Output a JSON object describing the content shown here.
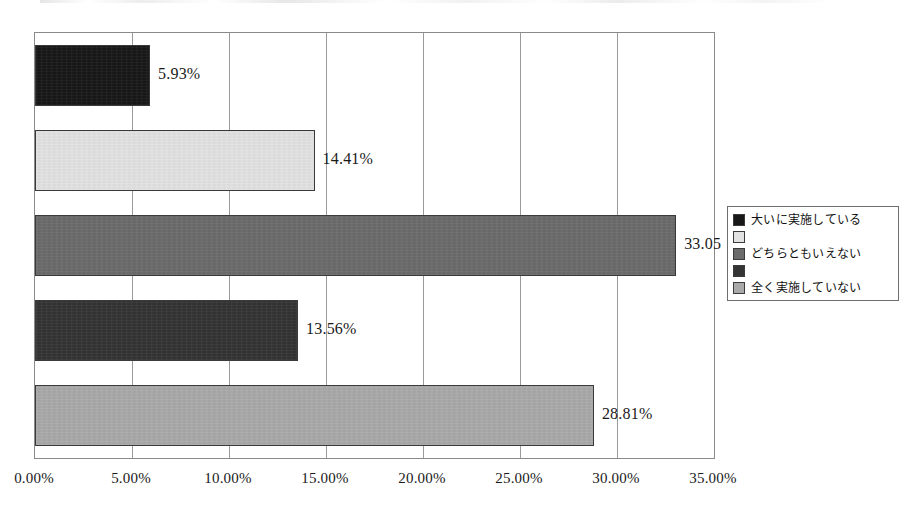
{
  "chart_data": {
    "type": "bar",
    "orientation": "horizontal",
    "title": "",
    "xlabel": "",
    "ylabel": "",
    "xlim": [
      0,
      35
    ],
    "grid": true,
    "legend_position": "right",
    "categories": [
      "大いに実施している",
      "",
      "どちらともいえない",
      "",
      "全く実施していない"
    ],
    "values": [
      5.93,
      14.41,
      33.05,
      13.56,
      28.81
    ],
    "data_labels": [
      "5.93%",
      "14.41%",
      "33.05",
      "13.56%",
      "28.81%"
    ],
    "colors": [
      "#181818",
      "#e2e2e2",
      "#6b6b6b",
      "#343434",
      "#a9a9a9"
    ],
    "tick_labels": [
      "0.00%",
      "5.00%",
      "10.00%",
      "15.00%",
      "20.00%",
      "25.00%",
      "30.00%",
      "35.00%"
    ],
    "tick_values": [
      0,
      5,
      10,
      15,
      20,
      25,
      30,
      35
    ]
  },
  "legend": {
    "items": [
      {
        "label": "大いに実施している",
        "color": "#181818"
      },
      {
        "label": "",
        "color": "#e2e2e2"
      },
      {
        "label": "どちらともいえない",
        "color": "#6b6b6b"
      },
      {
        "label": "",
        "color": "#343434"
      },
      {
        "label": "全く実施していない",
        "color": "#a9a9a9"
      }
    ]
  }
}
